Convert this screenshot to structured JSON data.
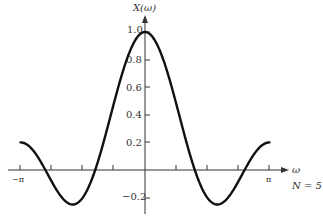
{
  "chart_data": {
    "type": "line",
    "title": "",
    "ylabel": "X(ω)",
    "xlabel": "ω",
    "annotation": "N = 5",
    "function": "X(ω) = sin(Nω/2) / (N sin(ω/2))",
    "N": 5,
    "xlim": [
      -3.14159,
      3.14159
    ],
    "ylim": [
      -0.3,
      1.1
    ],
    "x_tick_labels": [
      "−π",
      "π"
    ],
    "x_ticks": [
      -3.14159,
      -2.35619,
      -1.5708,
      -0.7854,
      0.7854,
      1.5708,
      2.35619,
      3.14159
    ],
    "y_tick_labels": [
      "−0.2",
      "0.2",
      "0.4",
      "0.6",
      "0.8",
      "1.0"
    ],
    "y_ticks": [
      -0.2,
      0.2,
      0.4,
      0.6,
      0.8,
      1.0
    ],
    "grid": false,
    "legend": null,
    "series": [
      {
        "name": "X(ω)",
        "x": [
          -3.1416,
          -2.8274,
          -2.5133,
          -2.1991,
          -1.885,
          -1.5708,
          -1.2566,
          -0.9425,
          -0.6283,
          -0.3142,
          0,
          0.3142,
          0.6283,
          0.9425,
          1.2566,
          1.5708,
          1.885,
          2.1991,
          2.5133,
          2.8274,
          3.1416
        ],
        "values": [
          0.2,
          0.128,
          0.0,
          -0.149,
          -0.247,
          -0.2,
          0.0,
          0.309,
          0.647,
          0.904,
          1.0,
          0.904,
          0.647,
          0.309,
          0.0,
          -0.2,
          -0.247,
          -0.149,
          0.0,
          0.128,
          0.2
        ]
      }
    ]
  },
  "labels": {
    "y_axis": "X(ω)",
    "x_axis": "ω",
    "n_note": "N = 5",
    "x_minus_pi": "−π",
    "x_pi": "π",
    "y_1_0": "1.0",
    "y_0_8": "0.8",
    "y_0_6": "0.6",
    "y_0_4": "0.4",
    "y_0_2": "0.2",
    "y_neg_0_2": "−0.2"
  },
  "style": {
    "curve_color": "#111111",
    "axis_color": "#333333"
  }
}
